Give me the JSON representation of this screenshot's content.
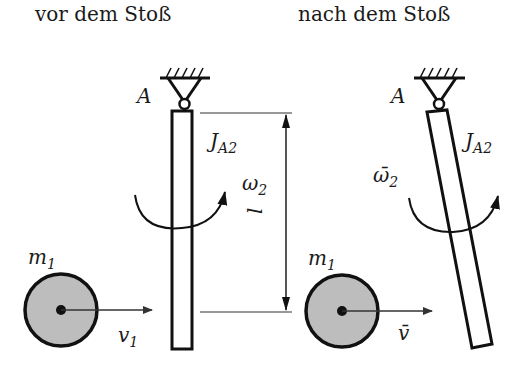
{
  "titles": {
    "before": "vor dem Stoß",
    "after": "nach dem Stoß"
  },
  "labels": {
    "pivot_before": "A",
    "pivot_after": "A",
    "inertia_before_main": "J",
    "inertia_before_sub": "A2",
    "inertia_after_main": "J",
    "inertia_after_sub": "A2",
    "omega_before_main": "ω",
    "omega_before_sub": "2",
    "omega_after_main": "ω̄",
    "omega_after_sub": "2",
    "length": "l",
    "mass_before_main": "m",
    "mass_before_sub": "1",
    "mass_after_main": "m",
    "mass_after_sub": "1",
    "velocity_before_main": "v",
    "velocity_before_sub": "1",
    "velocity_after": "v̄"
  },
  "colors": {
    "stroke": "#111111",
    "ball_fill": "#bdbdbd",
    "thin_line": "#333333"
  }
}
